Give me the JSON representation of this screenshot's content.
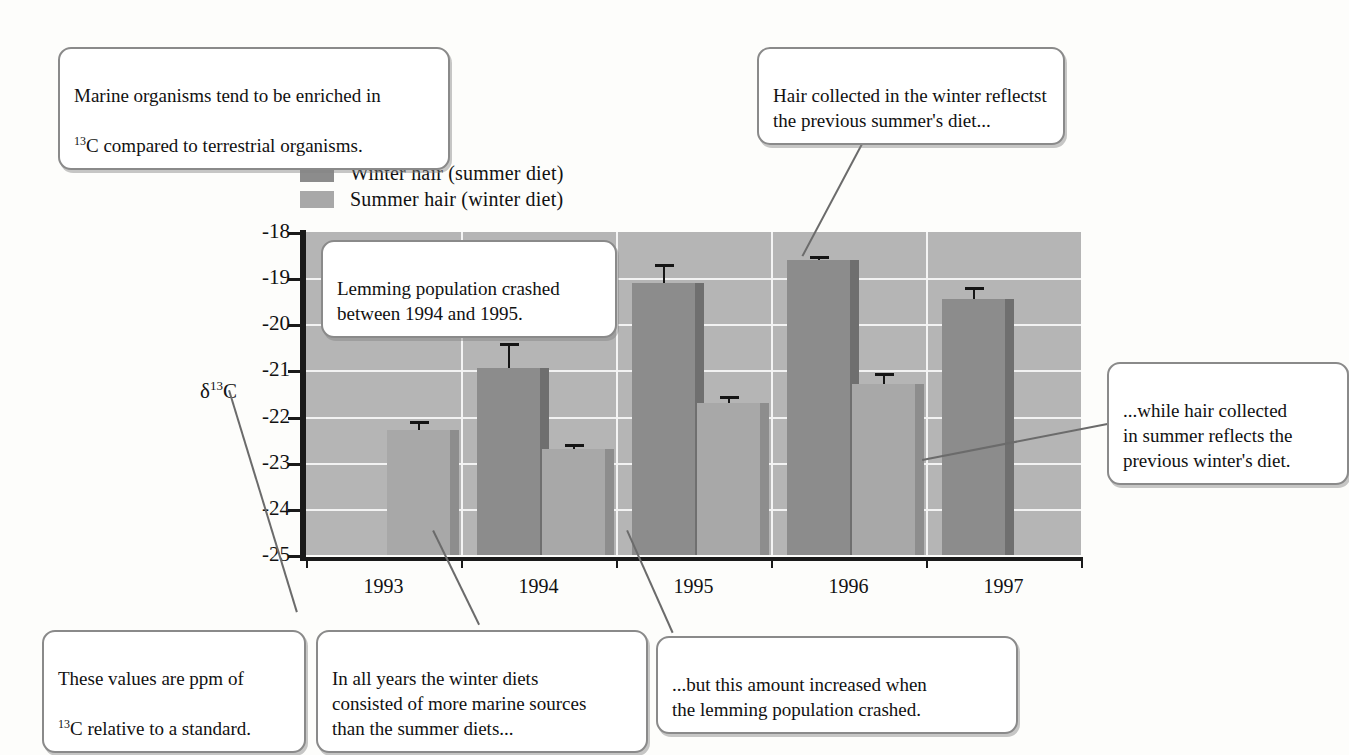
{
  "chart_data": {
    "type": "bar",
    "title": "",
    "xlabel": "",
    "ylabel": "δ¹³C",
    "categories": [
      "1993",
      "1994",
      "1995",
      "1996",
      "1997"
    ],
    "ylim": [
      -25,
      -18
    ],
    "yticks": [
      -18,
      -19,
      -20,
      -21,
      -22,
      -23,
      -24,
      -25
    ],
    "ytick_labels": [
      "-18",
      "-19",
      "-20",
      "-21",
      "-22",
      "-23",
      "-24",
      "-25"
    ],
    "grid": true,
    "legend_position": "above-plot",
    "series": [
      {
        "name": "Winter hair (summer diet)",
        "color": "#8c8c8c",
        "values": [
          null,
          -20.95,
          -19.1,
          -18.6,
          -19.45
        ],
        "errors": [
          null,
          0.55,
          0.4,
          0.0,
          0.25
        ]
      },
      {
        "name": "Summer hair (winter diet)",
        "color": "#a8a8a8",
        "values": [
          -22.3,
          -22.7,
          -21.7,
          -21.3,
          null
        ],
        "errors": [
          0.2,
          0.1,
          0.15,
          0.25,
          null
        ]
      }
    ],
    "bars": [
      {
        "year": "1993",
        "series": "Summer hair (winter diet)",
        "value": -22.3,
        "error": 0.2
      },
      {
        "year": "1994",
        "series": "Winter hair (summer diet)",
        "value": -20.95,
        "error": 0.55
      },
      {
        "year": "1994",
        "series": "Summer hair (winter diet)",
        "value": -22.7,
        "error": 0.1
      },
      {
        "year": "1995",
        "series": "Winter hair (summer diet)",
        "value": -19.1,
        "error": 0.4
      },
      {
        "year": "1995",
        "series": "Summer hair (winter diet)",
        "value": -21.7,
        "error": 0.15
      },
      {
        "year": "1996",
        "series": "Winter hair (summer diet)",
        "value": -18.6,
        "error": 0.0
      },
      {
        "year": "1996",
        "series": "Summer hair (winter diet)",
        "value": -21.3,
        "error": 0.25
      },
      {
        "year": "1997",
        "series": "Winter hair (summer diet)",
        "value": -19.45,
        "error": 0.25
      }
    ]
  },
  "legend": {
    "items": [
      {
        "label": "Winter hair (summer diet)",
        "color": "#8c8c8c"
      },
      {
        "label": "Summer hair (winter diet)",
        "color": "#a8a8a8"
      }
    ]
  },
  "axis": {
    "y_title_prefix": "δ",
    "y_title_sup": "13",
    "y_title_suffix": "C"
  },
  "callouts": {
    "marine": {
      "line1": "Marine organisms tend to be enriched in",
      "sup": "13",
      "line2_after_sup": "C compared to terrestrial organisms."
    },
    "winter_hair": "Hair collected in the winter reflectst\nthe previous summer's diet...",
    "lemming": "Lemming population crashed\nbetween 1994 and 1995.",
    "summer_hair": "...while hair collected\nin summer reflects the\nprevious winter's diet.",
    "ppm": {
      "line1": "These values are ppm of",
      "sup": "13",
      "line2_after_sup": "C relative to a standard."
    },
    "winter_diets": "In all years the winter diets\nconsisted of more marine sources\nthan the summer diets...",
    "increased": "...but this amount increased when\nthe lemming population crashed."
  }
}
